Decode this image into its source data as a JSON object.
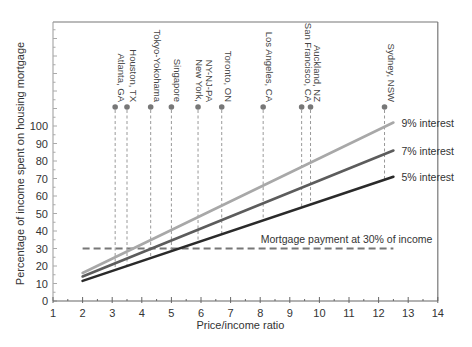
{
  "chart_data": {
    "type": "line",
    "title": "",
    "xlabel": "Price/income ratio",
    "ylabel": "Percentage of income spent on housing mortgage",
    "xlim": [
      1,
      14
    ],
    "ylim": [
      0,
      120
    ],
    "x_ticks": [
      1,
      2,
      3,
      4,
      5,
      6,
      7,
      8,
      9,
      10,
      11,
      12,
      13,
      14
    ],
    "y_ticks": [
      0,
      10,
      20,
      30,
      40,
      50,
      60,
      70,
      80,
      90,
      100
    ],
    "grid": false,
    "legend_position": "inline-right",
    "series": [
      {
        "name": "9% interest",
        "x": [
          2,
          12.5
        ],
        "values": [
          16,
          102
        ],
        "color": "#a8a8a8"
      },
      {
        "name": "7% interest",
        "x": [
          2,
          12.5
        ],
        "values": [
          14,
          86
        ],
        "color": "#5c5c5c"
      },
      {
        "name": "5% interest",
        "x": [
          2,
          12.5
        ],
        "values": [
          11.5,
          71
        ],
        "color": "#2a2a2a"
      }
    ],
    "reference_line": {
      "label": "Mortgage payment at 30% of income",
      "y": 30,
      "x": [
        2,
        12.5
      ],
      "style": "dashed",
      "color": "#777777"
    },
    "annotations": [
      {
        "label": [
          "Atlanta, GA"
        ],
        "x": 3.1
      },
      {
        "label": [
          "Houston, TX"
        ],
        "x": 3.5
      },
      {
        "label": [
          "Tokyo-Yokohama"
        ],
        "x": 4.3
      },
      {
        "label": [
          "Singapore"
        ],
        "x": 5.0
      },
      {
        "label": [
          "New York,",
          "NY-NJ-PA"
        ],
        "x": 5.9
      },
      {
        "label": [
          "Toronto, ON"
        ],
        "x": 6.7
      },
      {
        "label": [
          "Los Angeles, CA"
        ],
        "x": 8.1
      },
      {
        "label": [
          "San Francisco, CA"
        ],
        "x": 9.4
      },
      {
        "label": [
          "Auckland, NZ"
        ],
        "x": 9.7
      },
      {
        "label": [
          "Sydney, NSW"
        ],
        "x": 12.2
      }
    ]
  },
  "layout": {
    "x0_px": 53,
    "x_unit_px": 29.6,
    "y0_px": 301,
    "y_unit_px": 1.75,
    "frame_top_px": 22,
    "frame_right_px": 438,
    "dot_y_px": 107
  }
}
